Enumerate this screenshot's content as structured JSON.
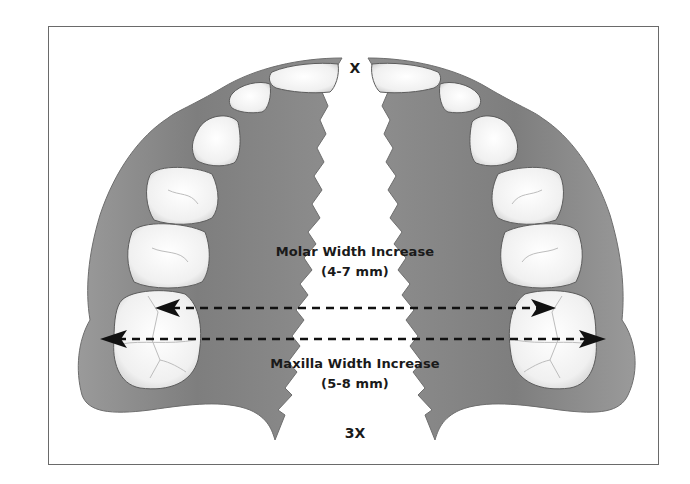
{
  "figure": {
    "type": "maxillary expansion diagram (palatal view, split midline)",
    "background_color": "#ffffff",
    "palate_color": "#8c8c8c",
    "tooth_color": "#f4f4f4",
    "arrow_color": "#111111"
  },
  "labels": {
    "top_marker": "X",
    "bottom_marker": "3X",
    "molar_title": "Molar Width Increase",
    "molar_range": "(4-7 mm)",
    "maxilla_title": "Maxilla Width Increase",
    "maxilla_range": "(5-8 mm)"
  },
  "arrows": [
    {
      "name": "molar-width-arrow",
      "style": "dashed double-headed",
      "y": 308,
      "x_start": 155,
      "x_end": 556
    },
    {
      "name": "maxilla-width-arrow",
      "style": "dashed double-headed",
      "y": 339,
      "x_start": 100,
      "x_end": 606
    }
  ]
}
